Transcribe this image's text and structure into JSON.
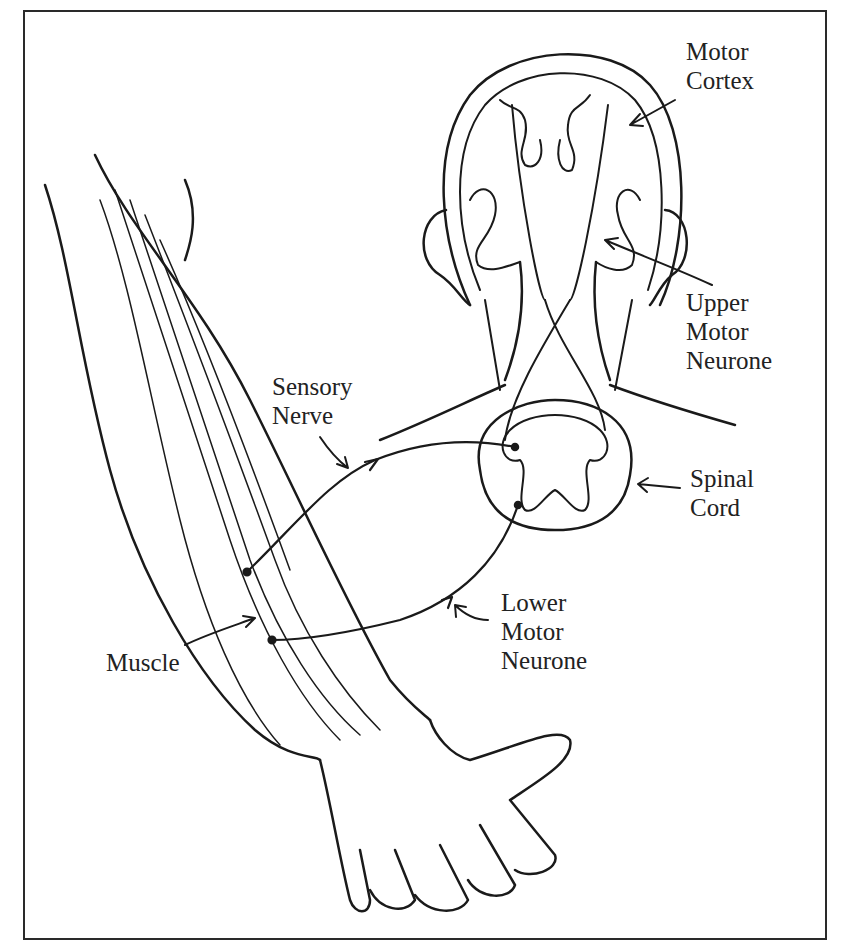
{
  "diagram": {
    "type": "anatomical-illustration",
    "labels": {
      "motor_cortex": [
        "Motor",
        "Cortex"
      ],
      "upper_motor_neurone": [
        "Upper",
        "Motor",
        "Neurone"
      ],
      "sensory_nerve": [
        "Sensory",
        "Nerve"
      ],
      "spinal_cord": [
        "Spinal",
        "Cord"
      ],
      "lower_motor_neurone": [
        "Lower",
        "Motor",
        "Neurone"
      ],
      "muscle": [
        "Muscle"
      ]
    },
    "colors": {
      "ink": "#1a1a1a",
      "background": "#ffffff",
      "frame": "#2a2a2a"
    }
  }
}
